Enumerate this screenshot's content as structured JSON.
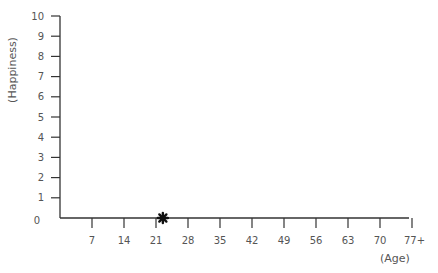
{
  "chart_data": {
    "type": "scatter",
    "title": "",
    "xlabel": "(Age)",
    "ylabel": "(Happiness)",
    "xlim": [
      0,
      77
    ],
    "ylim": [
      0,
      10
    ],
    "x_ticks": [
      "7",
      "14",
      "21",
      "28",
      "35",
      "42",
      "49",
      "56",
      "63",
      "70",
      "77+"
    ],
    "y_ticks": [
      "0",
      "1",
      "2",
      "3",
      "4",
      "5",
      "6",
      "7",
      "8",
      "9",
      "10"
    ],
    "grid": false,
    "legend": null,
    "series": [
      {
        "name": "point",
        "marker": "star",
        "color": "#111111",
        "points": [
          {
            "x": 22.5,
            "y": 0
          }
        ]
      }
    ]
  },
  "colors": {
    "axis": "#333333",
    "text": "#555555",
    "marker": "#111111"
  }
}
